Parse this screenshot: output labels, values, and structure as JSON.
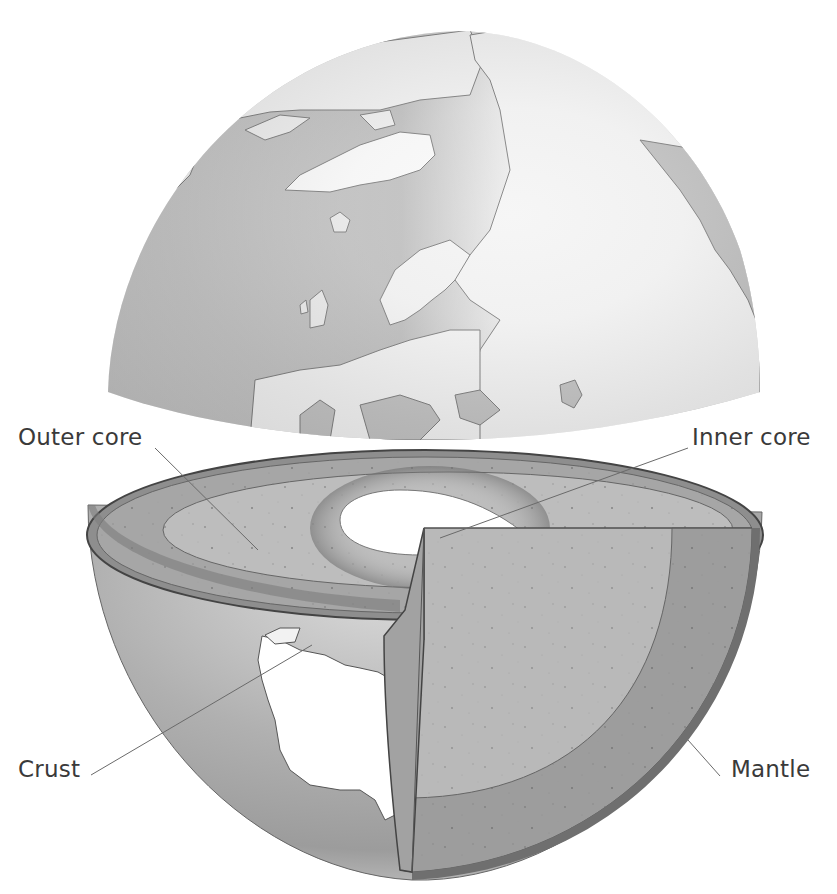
{
  "diagram": {
    "labels": {
      "outer_core": "Outer core",
      "inner_core": "Inner core",
      "crust": "Crust",
      "mantle": "Mantle"
    },
    "parts": [
      {
        "name": "Top hemisphere (northern globe with continents)"
      },
      {
        "name": "Bottom hemisphere cutaway showing layers"
      }
    ],
    "colors": {
      "ocean": "#a8a8a8",
      "land": "#ffffff",
      "crust": "#7a7a7a",
      "mantle": "#9a9a9a",
      "outer_core": "#b4b4b4",
      "inner_core": "#ffffff",
      "leader_line": "#6a6a6a",
      "label_text": "#3a3a3a"
    }
  }
}
